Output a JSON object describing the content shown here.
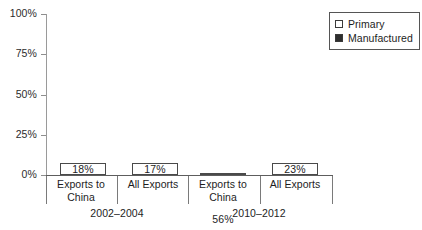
{
  "chart_data": {
    "type": "bar",
    "subtype": "stacked-100-percent",
    "title": "",
    "subtitle": "",
    "xlabel": "",
    "ylabel": "",
    "ylim": [
      0,
      100
    ],
    "yticks": [
      "0%",
      "25%",
      "50%",
      "75%",
      "100%"
    ],
    "ytick_values": [
      0,
      25,
      50,
      75,
      100
    ],
    "grid": false,
    "legend_position": "top-right",
    "categories": [
      "Exports to China",
      "All Exports",
      "Exports to China",
      "All Exports"
    ],
    "groups": [
      {
        "label": "2002–2004",
        "categories": [
          "Exports to China",
          "All Exports"
        ]
      },
      {
        "label": "2010–2012",
        "categories": [
          "Exports to China",
          "All Exports"
        ]
      }
    ],
    "series": [
      {
        "name": "Primary",
        "color": "#ffffff",
        "values": [
          18,
          17,
          56,
          23
        ],
        "labels": [
          "18%",
          "17%",
          "56%",
          "23%"
        ]
      },
      {
        "name": "Manufactured",
        "color": "#333333",
        "values": [
          82,
          83,
          44,
          77
        ],
        "labels": [
          "82%",
          "83%",
          "44%",
          "77%"
        ]
      }
    ],
    "bars": [
      {
        "category": "Exports to China",
        "group": "2002–2004",
        "primary": 18,
        "primary_label": "18%",
        "manufactured": 82,
        "manufactured_label": "82%"
      },
      {
        "category": "All Exports",
        "group": "2002–2004",
        "primary": 17,
        "primary_label": "17%",
        "manufactured": 83,
        "manufactured_label": "83%"
      },
      {
        "category": "Exports to China",
        "group": "2010–2012",
        "primary": 56,
        "primary_label": "56%",
        "manufactured": 44,
        "manufactured_label": "44%"
      },
      {
        "category": "All Exports",
        "group": "2010–2012",
        "primary": 23,
        "primary_label": "23%",
        "manufactured": 77,
        "manufactured_label": "77%"
      }
    ]
  },
  "axis": {
    "y_ticks": [
      {
        "label": "100%",
        "value": 100
      },
      {
        "label": "75%",
        "value": 75
      },
      {
        "label": "50%",
        "value": 50
      },
      {
        "label": "25%",
        "value": 25
      },
      {
        "label": "0%",
        "value": 0
      }
    ]
  },
  "cat_labels": [
    {
      "line1": "Exports to",
      "line2": "China"
    },
    {
      "line1": "All Exports",
      "line2": ""
    },
    {
      "line1": "Exports to",
      "line2": "China"
    },
    {
      "line1": "All Exports",
      "line2": ""
    }
  ],
  "group_labels": [
    {
      "label": "2002–2004"
    },
    {
      "label": "2010–2012"
    }
  ],
  "legend": {
    "items": [
      {
        "label": "Primary",
        "swatch": "primary",
        "color": "#ffffff"
      },
      {
        "label": "Manufactured",
        "swatch": "manufactured",
        "color": "#333333"
      }
    ]
  },
  "colors": {
    "primary_fill": "#ffffff",
    "manufactured_fill": "#333333",
    "bar_outline": "#4a4a4a",
    "axis": "#5d5d5d",
    "text": "#1d1d1d",
    "label_on_dark": "#ffffff"
  }
}
